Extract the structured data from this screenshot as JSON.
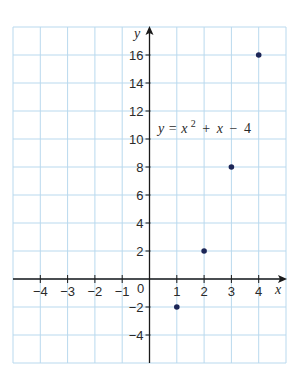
{
  "chart_data": {
    "type": "scatter",
    "title": "",
    "annotation": "y = x² + x − 4",
    "equation": {
      "lhs": "y",
      "eq": "=",
      "term1": "x",
      "exp": "2",
      "plus": "+",
      "term2": "x",
      "minus": "−",
      "const": "4"
    },
    "xlabel": "x",
    "ylabel": "y",
    "xlim": [
      -5,
      5
    ],
    "ylim": [
      -6,
      18
    ],
    "grid": true,
    "origin_label": "0",
    "x_ticks": [
      -4,
      -3,
      -2,
      -1,
      1,
      2,
      3,
      4
    ],
    "x_tick_labels": [
      "−4",
      "−3",
      "−2",
      "−1",
      "1",
      "2",
      "3",
      "4"
    ],
    "y_ticks": [
      -4,
      -2,
      2,
      4,
      6,
      8,
      10,
      12,
      14,
      16
    ],
    "y_tick_labels": [
      "−4",
      "−2",
      "2",
      "4",
      "6",
      "8",
      "10",
      "12",
      "14",
      "16"
    ],
    "series": [
      {
        "name": "y = x² + x − 4",
        "x": [
          1,
          2,
          3,
          4
        ],
        "y": [
          -2,
          2,
          8,
          16
        ]
      }
    ],
    "colors": {
      "grid": "#b9d9ee",
      "axis": "#1a1a1a",
      "point": "#1c2657"
    }
  }
}
